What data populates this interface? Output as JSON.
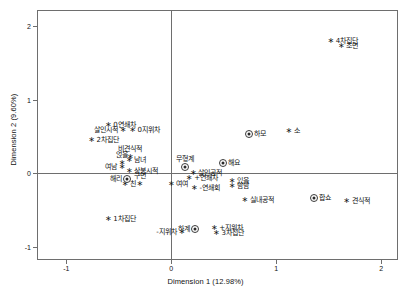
{
  "chart_data": {
    "type": "scatter",
    "title": "",
    "xlabel": "Dimension 1 (12.98%)",
    "ylabel": "Dimension 2 (9.60%)",
    "xlim": [
      -1.28,
      2.16
    ],
    "ylim": [
      -1.18,
      2.22
    ],
    "xticks": [
      -1,
      0,
      1,
      2
    ],
    "xticklabels": [
      "-1",
      "0",
      "1",
      "2"
    ],
    "yticks": [
      -1,
      0,
      1,
      2
    ],
    "yticklabels": [
      "-1",
      "0",
      "1",
      "2"
    ],
    "grid": false,
    "legend": "none",
    "reference_lines": {
      "x": 0,
      "y": 0
    },
    "series": [
      {
        "name": "category-star",
        "marker": "asterisk",
        "points": [
          {
            "label": "4차집단",
            "x": 1.52,
            "y": 1.8,
            "pos": "right"
          },
          {
            "label": "초면",
            "x": 1.62,
            "y": 1.73,
            "pos": "right"
          },
          {
            "label": "0연쇄차",
            "x": -0.6,
            "y": 0.65,
            "pos": "right"
          },
          {
            "label": "살인시적",
            "x": -0.46,
            "y": 0.59,
            "pos": "left"
          },
          {
            "label": "0지위차",
            "x": -0.37,
            "y": 0.59,
            "pos": "right"
          },
          {
            "label": "소",
            "x": 1.12,
            "y": 0.58,
            "pos": "right"
          },
          {
            "label": "2차집단",
            "x": -0.76,
            "y": 0.45,
            "pos": "right"
          },
          {
            "label": "비견식적",
            "x": -0.39,
            "y": 0.22,
            "pos": "above"
          },
          {
            "label": "남녀",
            "x": -0.4,
            "y": 0.18,
            "pos": "right"
          },
          {
            "label": "얹을",
            "x": -0.47,
            "y": 0.14,
            "pos": "above"
          },
          {
            "label": "여남",
            "x": -0.47,
            "y": 0.09,
            "pos": "left"
          },
          {
            "label": "상봉시적",
            "x": -0.4,
            "y": 0.03,
            "pos": "right"
          },
          {
            "label": "살인공적",
            "x": 0.21,
            "y": 0.01,
            "pos": "right"
          },
          {
            "label": "구면",
            "x": -0.3,
            "y": -0.14,
            "pos": "above"
          },
          {
            "label": "친",
            "x": -0.44,
            "y": -0.15,
            "pos": "right"
          },
          {
            "label": "+연쇄차",
            "x": 0.17,
            "y": -0.07,
            "pos": "right"
          },
          {
            "label": "있을",
            "x": 0.58,
            "y": -0.1,
            "pos": "right"
          },
          {
            "label": "남남",
            "x": 0.58,
            "y": -0.17,
            "pos": "right"
          },
          {
            "label": "여여",
            "x": 0.0,
            "y": -0.15,
            "pos": "right"
          },
          {
            "label": "-연쇄회",
            "x": 0.22,
            "y": -0.2,
            "pos": "right"
          },
          {
            "label": "실내공적",
            "x": 0.7,
            "y": -0.36,
            "pos": "right"
          },
          {
            "label": "견식적",
            "x": 1.67,
            "y": -0.38,
            "pos": "right"
          },
          {
            "label": "1차집단",
            "x": -0.6,
            "y": -0.62,
            "pos": "right"
          },
          {
            "label": "-지위차",
            "x": 0.1,
            "y": -0.8,
            "pos": "left"
          },
          {
            "label": "+지위차",
            "x": 0.41,
            "y": -0.75,
            "pos": "right"
          },
          {
            "label": "3차집단",
            "x": 0.43,
            "y": -0.81,
            "pos": "right"
          }
        ]
      },
      {
        "name": "category-target",
        "marker": "target",
        "points": [
          {
            "label": "하모",
            "x": 0.74,
            "y": 0.53,
            "pos": "right"
          },
          {
            "label": "해요",
            "x": 0.49,
            "y": 0.14,
            "pos": "right"
          },
          {
            "label": "무형계",
            "x": 0.13,
            "y": 0.09,
            "pos": "above"
          },
          {
            "label": "해리",
            "x": -0.42,
            "y": -0.08,
            "pos": "left"
          },
          {
            "label": "합쇼",
            "x": 1.36,
            "y": -0.33,
            "pos": "right"
          },
          {
            "label": "하계",
            "x": 0.23,
            "y": -0.76,
            "pos": "left"
          }
        ]
      }
    ]
  },
  "axes": {
    "x_title": "Dimension 1 (12.98%)",
    "y_title": "Dimension 2 (9.60%)"
  }
}
